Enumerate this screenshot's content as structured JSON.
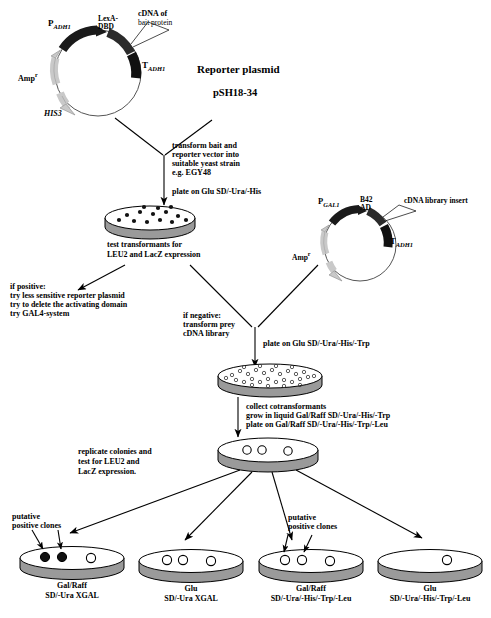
{
  "figure": {
    "type": "flowchart-diagram"
  },
  "bait_plasmid": {
    "name": "bait-plasmid",
    "labels": {
      "promoter_p": "P",
      "promoter_sub": "ADH1",
      "lexa": "LexA-\nDBD",
      "cdna": "cDNA of",
      "cdna2": "bait protein",
      "term_t": "T",
      "term_sub": "ADH1",
      "amp": "Amp",
      "amp_sup": "r",
      "his3": "HIS3"
    }
  },
  "reporter_plasmid": {
    "title": "Reporter plasmid",
    "name": "pSH18-34"
  },
  "prey_plasmid": {
    "name": "prey-plasmid",
    "labels": {
      "promoter_p": "P",
      "promoter_sub": "GAL1",
      "b42": "B42",
      "ad": "AD",
      "insert": "cDNA library insert",
      "term_t": "T",
      "term_sub": "ADH1",
      "amp": "Amp",
      "amp_sup": "r"
    }
  },
  "steps": {
    "transform": "transform bait and\nreporter vector into\nsuitable yeast strain\ne.g. EGY48",
    "plate_glu_ura_his": "plate on Glu SD/-Ura/-His",
    "test_transformants_l1": "test transformants for",
    "test_transformants_l2_italic": "LEU2",
    "test_transformants_l2_rest": " and LacZ expression",
    "if_positive": "if positive:\ntry less sensitive reporter plasmid\ntry to delete the activating domain\ntry GAL4-system",
    "if_negative": "if negative:\ntransform prey\ncDNA library",
    "plate_glu_ura_his_trp": "plate on Glu SD/-Ura/-His/-Trp",
    "collect": "collect cotransformants\ngrow in liquid Gal/Raff SD/-Ura/-His/-Trp\nplate on Gal/Raff SD/-Ura/-His/-Trp/-Leu",
    "replicate_l1": "replicate colonies and",
    "replicate_l2a": "test for ",
    "replicate_l2b_italic": "LEU2",
    "replicate_l2c": " and",
    "replicate_l3a_italic": "LacZ",
    "replicate_l3b": " expression."
  },
  "annotations": {
    "putative_left": "putative\npositive clones",
    "putative_right": "putative\npositive clones"
  },
  "result_plates": [
    {
      "id": "plate-galraff-xgal",
      "line1": "Gal/Raff",
      "line2": "SD/-Ura XGAL",
      "filled_colonies": 2,
      "open_colonies": 1
    },
    {
      "id": "plate-glu-xgal",
      "line1": "Glu",
      "line2": "SD/-Ura XGAL",
      "filled_colonies": 0,
      "open_colonies": 3
    },
    {
      "id": "plate-galraff-dropout",
      "line1": "Gal/Raff",
      "line2": "SD/-Ura/-His/-Trp/-Leu",
      "filled_colonies": 0,
      "open_colonies": 3
    },
    {
      "id": "plate-glu-dropout",
      "line1": "Glu",
      "line2": "SD/-Ura/-His/-Trp/-Leu",
      "filled_colonies": 0,
      "open_colonies": 1
    }
  ],
  "colors": {
    "ink": "#000000",
    "dark_segment": "#1a1a1a",
    "light_segment": "#c9c9c9",
    "plate_side": "#9a9a9a",
    "plate_top": "#ffffff"
  }
}
